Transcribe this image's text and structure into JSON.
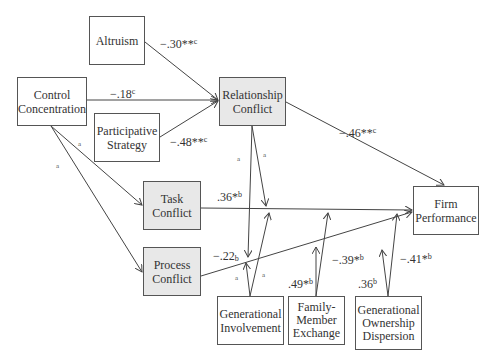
{
  "diagram": {
    "type": "path model",
    "nodes": [
      {
        "id": "altruism",
        "label": "Altruism",
        "shaded": false,
        "x": 89,
        "y": 16,
        "w": 56,
        "h": 49
      },
      {
        "id": "control_concentration",
        "label": "Control\nConcentration",
        "shaded": false,
        "x": 17,
        "y": 77,
        "w": 70,
        "h": 49
      },
      {
        "id": "participative_strategy",
        "label": "Participative\nStrategy",
        "shaded": false,
        "x": 94,
        "y": 113,
        "w": 66,
        "h": 49
      },
      {
        "id": "relationship_conflict",
        "label": "Relationship\nConflict",
        "shaded": true,
        "x": 219,
        "y": 77,
        "w": 67,
        "h": 49
      },
      {
        "id": "task_conflict",
        "label": "Task\nConflict",
        "shaded": true,
        "x": 143,
        "y": 181,
        "w": 58,
        "h": 49
      },
      {
        "id": "process_conflict",
        "label": "Process\nConflict",
        "shaded": true,
        "x": 143,
        "y": 247,
        "w": 58,
        "h": 49
      },
      {
        "id": "firm_performance",
        "label": "Firm\nPerformance",
        "shaded": false,
        "x": 413,
        "y": 186,
        "w": 66,
        "h": 49
      },
      {
        "id": "generational_involvement",
        "label": "Generational\nInvolvement",
        "shaded": false,
        "x": 217,
        "y": 296,
        "w": 67,
        "h": 49
      },
      {
        "id": "family_member_exchange",
        "label": "Family-\nMember\nExchange",
        "shaded": false,
        "x": 288,
        "y": 296,
        "w": 57,
        "h": 49
      },
      {
        "id": "generational_ownership_dispersion",
        "label": "Generational\nOwnership\nDispersion",
        "shaded": false,
        "x": 355,
        "y": 296,
        "w": 67,
        "h": 49
      }
    ],
    "edges": [
      {
        "from": "altruism",
        "to": "relationship_conflict",
        "coef": "−.30",
        "sig": "**",
        "note": "c"
      },
      {
        "from": "control_concentration",
        "to": "relationship_conflict",
        "coef": "−.18",
        "sig": "",
        "note": "c"
      },
      {
        "from": "participative_strategy",
        "to": "relationship_conflict",
        "coef": "−.48",
        "sig": "**",
        "note": "c"
      },
      {
        "from": "relationship_conflict",
        "to": "firm_performance",
        "coef": "−.46",
        "sig": "**",
        "note": "c"
      },
      {
        "from": "control_concentration",
        "to": "task_conflict",
        "coef": "",
        "sig": "",
        "note": "a"
      },
      {
        "from": "control_concentration",
        "to": "process_conflict",
        "coef": "",
        "sig": "",
        "note": "a"
      },
      {
        "from": "task_conflict",
        "to": "firm_performance",
        "coef": ".36",
        "sig": "*",
        "note": "b"
      },
      {
        "from": "process_conflict",
        "to": "firm_performance",
        "coef": "−.22",
        "sig": "",
        "note": "b"
      },
      {
        "from": "relationship_conflict",
        "to": "task_process_moderation",
        "coef": "",
        "sig": "",
        "note": "a"
      },
      {
        "from": "generational_involvement",
        "to": "conflict_moderation",
        "coef": "",
        "sig": "",
        "note": "a"
      },
      {
        "from": "family_member_exchange",
        "to": "conflict_performance_link",
        "coef": ".49",
        "sig": "*",
        "note": "b"
      },
      {
        "from": "family_member_exchange",
        "to": "task_conflict_performance_link",
        "coef": "−.39",
        "sig": "*",
        "note": "b"
      },
      {
        "from": "generational_ownership_dispersion",
        "to": "process_conflict_performance_link",
        "coef": ".36",
        "sig": "",
        "note": "b"
      },
      {
        "from": "generational_ownership_dispersion",
        "to": "firm_performance_link",
        "coef": "−.41",
        "sig": "*",
        "note": "b"
      }
    ]
  },
  "labels": {
    "altruism_coef": "−.30**",
    "altruism_note": "c",
    "control_coef": "−.18",
    "control_note": "c",
    "participative_coef": "−.48**",
    "participative_note": "c",
    "relationship_perf_coef": "−.46**",
    "relationship_perf_note": "c",
    "task_perf_coef": ".36*",
    "task_perf_note": "b",
    "process_perf_coef": "−.22",
    "process_perf_note": "b",
    "fme_coef1": ".49*",
    "fme_note1": "b",
    "fme_coef2": "−.39*",
    "fme_note2": "b",
    "god_coef1": ".36",
    "god_note1": "b",
    "god_coef2": "−.41*",
    "god_note2": "b",
    "a": "a"
  }
}
